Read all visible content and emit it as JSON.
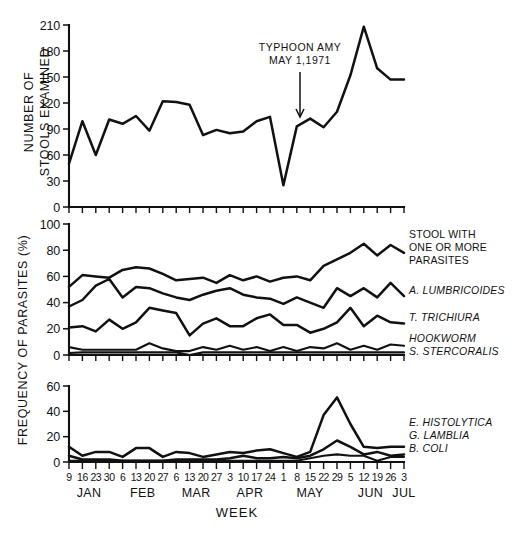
{
  "figure": {
    "xaxis_title": "WEEK",
    "annotation": {
      "line1": "TYPHOON AMY",
      "line2": "MAY 1,1971"
    },
    "weeks": [
      "9",
      "16",
      "23",
      "30",
      "6",
      "13",
      "20",
      "27",
      "6",
      "13",
      "20",
      "27",
      "3",
      "10",
      "17",
      "24",
      "1",
      "8",
      "15",
      "22",
      "29",
      "5",
      "12",
      "19",
      "26",
      "3"
    ],
    "months": [
      {
        "name": "JAN",
        "start": 0,
        "count": 4
      },
      {
        "name": "FEB",
        "start": 4,
        "count": 4
      },
      {
        "name": "MAR",
        "start": 8,
        "count": 4
      },
      {
        "name": "APR",
        "start": 12,
        "count": 4
      },
      {
        "name": "MAY",
        "start": 16,
        "count": 5
      },
      {
        "name": "JUN",
        "start": 21,
        "count": 4
      },
      {
        "name": "JUL",
        "start": 25,
        "count": 1
      }
    ]
  },
  "chart_data": [
    {
      "type": "line",
      "panel": "top",
      "title": "",
      "ylabel": "NUMBER OF STOOLS EXAMINED",
      "ylabel_line1": "NUMBER OF",
      "ylabel_line2": "STOOLS EXAMINED",
      "xlabel": "WEEK",
      "ylim": [
        0,
        210
      ],
      "yticks": [
        0,
        30,
        60,
        90,
        120,
        150,
        180,
        210
      ],
      "grid": false,
      "x": [
        "9",
        "16",
        "23",
        "30",
        "6",
        "13",
        "20",
        "27",
        "6",
        "13",
        "20",
        "27",
        "3",
        "10",
        "17",
        "24",
        "1",
        "8",
        "15",
        "22",
        "29",
        "5",
        "12",
        "19",
        "26",
        "3"
      ],
      "series": [
        {
          "name": "Number of stools examined",
          "values": [
            50,
            99,
            60,
            101,
            96,
            105,
            88,
            122,
            121,
            118,
            83,
            89,
            85,
            87,
            99,
            104,
            25,
            93,
            102,
            92,
            110,
            152,
            208,
            160,
            147,
            147
          ]
        }
      ]
    },
    {
      "type": "line",
      "panel": "middle",
      "title": "",
      "ylabel": "FREQUENCY OF PARASITES (%)",
      "xlabel": "WEEK",
      "ylim": [
        0,
        100
      ],
      "yticks": [
        0,
        20,
        40,
        60,
        80,
        100
      ],
      "grid": false,
      "x": [
        "9",
        "16",
        "23",
        "30",
        "6",
        "13",
        "20",
        "27",
        "6",
        "13",
        "20",
        "27",
        "3",
        "10",
        "17",
        "24",
        "1",
        "8",
        "15",
        "22",
        "29",
        "5",
        "12",
        "19",
        "26",
        "3"
      ],
      "series": [
        {
          "name": "STOOL WITH ONE OR MORE PARASITES",
          "label_line1": "STOOL WITH",
          "label_line2": "ONE OR MORE",
          "label_line3": "PARASITES",
          "values": [
            52,
            61,
            60,
            59,
            65,
            67,
            66,
            62,
            57,
            58,
            59,
            55,
            61,
            57,
            60,
            56,
            59,
            60,
            57,
            68,
            73,
            78,
            85,
            76,
            84,
            78
          ]
        },
        {
          "name": "A. LUMBRICOIDES",
          "values": [
            37,
            42,
            53,
            58,
            44,
            52,
            51,
            47,
            44,
            42,
            46,
            49,
            51,
            46,
            44,
            43,
            39,
            44,
            40,
            36,
            51,
            45,
            51,
            44,
            55,
            45
          ]
        },
        {
          "name": "T. TRICHIURA",
          "values": [
            21,
            22,
            18,
            27,
            20,
            25,
            36,
            34,
            32,
            15,
            24,
            28,
            22,
            22,
            28,
            31,
            23,
            23,
            17,
            20,
            25,
            36,
            22,
            30,
            25,
            24
          ]
        },
        {
          "name": "HOOKWORM",
          "values": [
            6,
            4,
            4,
            4,
            4,
            4,
            9,
            5,
            3,
            3,
            6,
            4,
            7,
            4,
            6,
            3,
            6,
            3,
            6,
            5,
            9,
            4,
            7,
            4,
            8,
            7
          ]
        },
        {
          "name": "S. STERCORALIS",
          "values": [
            1.5,
            2,
            2,
            2,
            2,
            2,
            2,
            2,
            2,
            0,
            2,
            2,
            2,
            2,
            2,
            2,
            2,
            2,
            2,
            2,
            2,
            2,
            2,
            2,
            2,
            2
          ]
        }
      ]
    },
    {
      "type": "line",
      "panel": "bottom",
      "title": "",
      "ylabel": "FREQUENCY",
      "xlabel": "WEEK",
      "ylim": [
        0,
        60
      ],
      "yticks": [
        0,
        20,
        40,
        60
      ],
      "grid": false,
      "x": [
        "9",
        "16",
        "23",
        "30",
        "6",
        "13",
        "20",
        "27",
        "6",
        "13",
        "20",
        "27",
        "3",
        "10",
        "17",
        "24",
        "1",
        "8",
        "15",
        "22",
        "29",
        "5",
        "12",
        "19",
        "26",
        "3"
      ],
      "series": [
        {
          "name": "E. HISTOLYTICA",
          "values": [
            12,
            5,
            8,
            8,
            4,
            11,
            11,
            4,
            8,
            7,
            4,
            6,
            8,
            7,
            9,
            10,
            7,
            4,
            8,
            37,
            51,
            30,
            12,
            11,
            12,
            12
          ]
        },
        {
          "name": "G. LAMBLIA",
          "values": [
            5,
            2,
            2,
            2,
            1,
            1,
            1,
            1,
            2,
            2,
            2,
            2,
            3,
            5,
            3,
            3,
            4,
            3,
            5,
            10,
            17,
            12,
            6,
            8,
            5,
            6
          ]
        },
        {
          "name": "B. COLI",
          "values": [
            1,
            1,
            1,
            1,
            1,
            1,
            1,
            1,
            1,
            1,
            1,
            1,
            1,
            1,
            1,
            1,
            1,
            1,
            3,
            5,
            6,
            5,
            5,
            1,
            4,
            4
          ]
        }
      ]
    }
  ]
}
